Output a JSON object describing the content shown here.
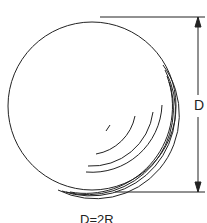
{
  "diagram": {
    "type": "sphere-dimension",
    "dimension_label": "D",
    "formula": "D=2R",
    "colors": {
      "stroke": "#222222",
      "background": "#ffffff"
    }
  }
}
